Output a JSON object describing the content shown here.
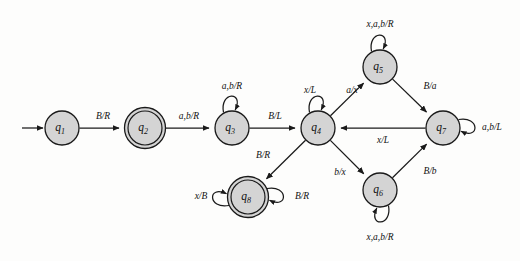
{
  "diagram": {
    "type": "state-transition-diagram",
    "width": 520,
    "height": 261,
    "background_color": "#fdfdfc",
    "node_fill_color": "#d4d4d4",
    "stroke_color": "#1a1a1a",
    "alphabet": [
      "a",
      "b",
      "x",
      "B"
    ],
    "head_moves": [
      "L",
      "R"
    ],
    "start_state": "q1",
    "accepting_states": [
      "q2",
      "q8"
    ],
    "nodes": [
      {
        "id": "q1",
        "label": "q",
        "sub": "1",
        "cx": 62,
        "cy": 128,
        "r": 17,
        "accepting": false
      },
      {
        "id": "q2",
        "label": "q",
        "sub": "2",
        "cx": 145,
        "cy": 128,
        "r": 17,
        "accepting": true
      },
      {
        "id": "q3",
        "label": "q",
        "sub": "3",
        "cx": 232,
        "cy": 128,
        "r": 17,
        "accepting": false
      },
      {
        "id": "q4",
        "label": "q",
        "sub": "4",
        "cx": 318,
        "cy": 128,
        "r": 17,
        "accepting": false
      },
      {
        "id": "q5",
        "label": "q",
        "sub": "5",
        "cx": 380,
        "cy": 67,
        "r": 17,
        "accepting": false
      },
      {
        "id": "q6",
        "label": "q",
        "sub": "6",
        "cx": 380,
        "cy": 190,
        "r": 17,
        "accepting": false
      },
      {
        "id": "q7",
        "label": "q",
        "sub": "7",
        "cx": 443,
        "cy": 128,
        "r": 17,
        "accepting": false
      },
      {
        "id": "q8",
        "label": "q",
        "sub": "8",
        "cx": 248,
        "cy": 197,
        "r": 17,
        "accepting": true
      }
    ],
    "start_arrow": {
      "from_x": 22,
      "to_x": 43,
      "y": 128
    },
    "edges": [
      {
        "id": "e_q1_q2",
        "from": "q1",
        "to": "q2",
        "label": "B/R",
        "label_x": 103,
        "label_y": 117
      },
      {
        "id": "e_q2_q3",
        "from": "q2",
        "to": "q3",
        "label": "a,b/R",
        "label_x": 189,
        "label_y": 117
      },
      {
        "id": "e_q3_q4",
        "from": "q3",
        "to": "q4",
        "label": "B/L",
        "label_x": 275,
        "label_y": 117
      },
      {
        "id": "e_q4_q5",
        "from": "q4",
        "to": "q5",
        "label": "a/x",
        "label_x": 352,
        "label_y": 91
      },
      {
        "id": "e_q5_q7",
        "from": "q5",
        "to": "q7",
        "label": "B/a",
        "label_x": 430,
        "label_y": 87
      },
      {
        "id": "e_q7_q4",
        "from": "q7",
        "to": "q4",
        "label": "x/L",
        "label_x": 383,
        "label_y": 141
      },
      {
        "id": "e_q4_q6",
        "from": "q4",
        "to": "q6",
        "label": "b/x",
        "label_x": 340,
        "label_y": 173
      },
      {
        "id": "e_q6_q7",
        "from": "q6",
        "to": "q7",
        "label": "B/b",
        "label_x": 430,
        "label_y": 172
      },
      {
        "id": "e_q4_q8",
        "from": "q4",
        "to": "q8",
        "label": "B/R",
        "label_x": 263,
        "label_y": 156
      }
    ],
    "self_loops": [
      {
        "id": "loop_q3",
        "state": "q3",
        "label": "a,b/R",
        "position": "top",
        "label_x": 232,
        "label_y": 87
      },
      {
        "id": "loop_q4",
        "state": "q4",
        "label": "x/L",
        "position": "top",
        "label_x": 310,
        "label_y": 91
      },
      {
        "id": "loop_q5",
        "state": "q5",
        "label": "x,a,b/R",
        "position": "top",
        "label_x": 380,
        "label_y": 25
      },
      {
        "id": "loop_q6",
        "state": "q6",
        "label": "x,a,b/R",
        "position": "bottom",
        "label_x": 380,
        "label_y": 238
      },
      {
        "id": "loop_q7",
        "state": "q7",
        "label": "a,b/L",
        "position": "right",
        "label_x": 492,
        "label_y": 128
      },
      {
        "id": "loop_q8_left",
        "state": "q8",
        "label": "x/B",
        "position": "left",
        "label_x": 201,
        "label_y": 197
      },
      {
        "id": "loop_q8_right",
        "state": "q8",
        "label": "B/R",
        "position": "right",
        "label_x": 302,
        "label_y": 197
      }
    ]
  }
}
